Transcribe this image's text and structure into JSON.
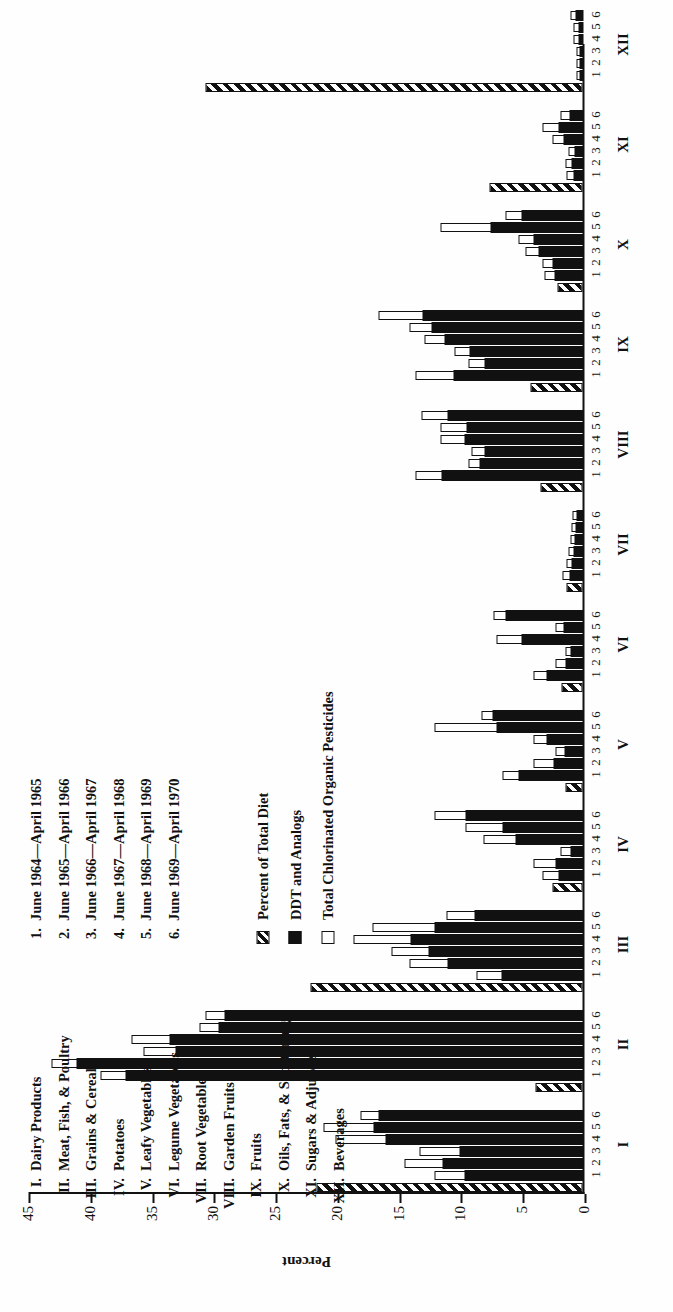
{
  "chart_data": {
    "type": "bar",
    "title": "",
    "xlabel": "",
    "ylabel": "Percent",
    "ylim": [
      0,
      45
    ],
    "yticks": [
      0,
      5,
      10,
      15,
      20,
      25,
      30,
      35,
      40,
      45
    ],
    "grid": false,
    "orientation": "vertical-rotated-90",
    "legend_position": "upper-left",
    "legend": [
      {
        "key": "percent_of_total_diet",
        "label": "Percent of Total Diet",
        "pattern": "hatched"
      },
      {
        "key": "ddt_and_analogs",
        "label": "DDT and Analogs",
        "pattern": "solid-black"
      },
      {
        "key": "total_chlorinated",
        "label": "Total Chlorinated Organic Pesticides",
        "pattern": "open-white"
      }
    ],
    "period_labels": [
      {
        "n": "1.",
        "text": "June 1964—April 1965"
      },
      {
        "n": "2.",
        "text": "June 1965—April 1966"
      },
      {
        "n": "3.",
        "text": "June 1966—April 1967"
      },
      {
        "n": "4.",
        "text": "June 1967—April 1968"
      },
      {
        "n": "5.",
        "text": "June 1968—April 1969"
      },
      {
        "n": "6.",
        "text": "June 1969—April 1970"
      }
    ],
    "categories": [
      {
        "numeral": "I.",
        "tick": "I",
        "name": "Dairy Products"
      },
      {
        "numeral": "II.",
        "tick": "II",
        "name": "Meat, Fish, & Poultry"
      },
      {
        "numeral": "III.",
        "tick": "III",
        "name": "Grains & Cereal"
      },
      {
        "numeral": "IV.",
        "tick": "IV",
        "name": "Potatoes"
      },
      {
        "numeral": "V.",
        "tick": "V",
        "name": "Leafy Vegetables"
      },
      {
        "numeral": "VI.",
        "tick": "VI",
        "name": "Legume Vegetables"
      },
      {
        "numeral": "VII.",
        "tick": "VII",
        "name": "Root Vegetables"
      },
      {
        "numeral": "VIII.",
        "tick": "VIII",
        "name": "Garden Fruits"
      },
      {
        "numeral": "IX.",
        "tick": "IX",
        "name": "Fruits"
      },
      {
        "numeral": "X.",
        "tick": "X",
        "name": "Oils, Fats, & Shortening"
      },
      {
        "numeral": "XI.",
        "tick": "XI",
        "name": "Sugars & Adjuncts"
      },
      {
        "numeral": "XII.",
        "tick": "XII",
        "name": "Beverages"
      }
    ],
    "tick_numbers": [
      "1",
      "2",
      "3",
      "4",
      "5",
      "6"
    ],
    "series": [
      {
        "name": "Percent of Total Diet",
        "pattern": "hatched",
        "values": [
          21.5,
          3.8,
          22.0,
          2.4,
          1.4,
          1.7,
          1.3,
          3.4,
          4.2,
          2.0,
          7.5,
          30.5
        ]
      },
      {
        "name": "DDT and Analogs",
        "pattern": "solid-black",
        "values": [
          [
            9.6,
            11.4,
            10.0,
            16.0,
            17.0,
            16.6
          ],
          [
            37.0,
            41.0,
            33.0,
            33.5,
            29.5,
            29.0
          ],
          [
            6.6,
            11.0,
            12.5,
            14.0,
            12.0,
            8.8
          ],
          [
            2.0,
            2.2,
            1.0,
            5.5,
            6.5,
            9.5
          ],
          [
            5.2,
            2.4,
            1.5,
            3.0,
            7.0,
            7.3
          ],
          [
            3.0,
            1.4,
            1.0,
            5.0,
            1.6,
            6.3
          ],
          [
            1.1,
            0.9,
            0.8,
            0.7,
            0.6,
            0.5
          ],
          [
            11.5,
            8.4,
            8.0,
            9.6,
            9.4,
            11.0
          ],
          [
            10.5,
            8.0,
            9.2,
            11.2,
            12.3,
            13.0
          ],
          [
            2.3,
            2.5,
            3.6,
            4.0,
            7.5,
            5.0
          ],
          [
            0.8,
            0.9,
            0.7,
            1.6,
            2.0,
            1.1
          ],
          [
            0.3,
            0.3,
            0.3,
            0.4,
            0.4,
            0.6
          ]
        ]
      },
      {
        "name": "Total Chlorinated Organic Pesticides",
        "pattern": "open-white",
        "values": [
          [
            12.0,
            14.4,
            13.2,
            20.0,
            21.0,
            18.0
          ],
          [
            39.0,
            43.0,
            35.5,
            36.5,
            31.0,
            30.5
          ],
          [
            8.6,
            14.0,
            15.5,
            18.5,
            17.0,
            11.0
          ],
          [
            3.2,
            4.0,
            1.8,
            8.0,
            9.5,
            12.0
          ],
          [
            6.5,
            4.0,
            2.2,
            4.0,
            12.0,
            8.2
          ],
          [
            4.0,
            2.2,
            1.4,
            7.0,
            2.2,
            7.2
          ],
          [
            1.6,
            1.3,
            1.1,
            1.0,
            0.9,
            0.8
          ],
          [
            13.5,
            9.2,
            9.0,
            11.5,
            11.5,
            13.0
          ],
          [
            13.5,
            9.2,
            10.4,
            12.8,
            14.0,
            16.5
          ],
          [
            3.1,
            3.2,
            4.6,
            5.2,
            11.5,
            6.2
          ],
          [
            1.3,
            1.4,
            1.1,
            2.4,
            3.2,
            1.8
          ],
          [
            0.5,
            0.5,
            0.5,
            0.7,
            0.7,
            1.0
          ]
        ]
      }
    ]
  }
}
